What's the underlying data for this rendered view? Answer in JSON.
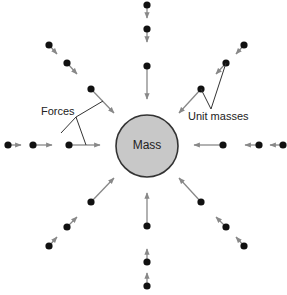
{
  "diagram": {
    "center_label": "Mass",
    "labels": {
      "forces": "Forces",
      "unit_masses": "Unit masses"
    },
    "colors": {
      "mass_fill": "#c8c8c8",
      "mass_stroke": "#333333",
      "dot": "#111111",
      "arrow": "#888888",
      "leader": "#333333"
    },
    "center": {
      "x": 147,
      "y": 146,
      "r": 31
    },
    "unit_masses": [
      {
        "x": 147,
        "y": 5,
        "tx": 147,
        "ty": 18
      },
      {
        "x": 147,
        "y": 29,
        "tx": 147,
        "ty": 42
      },
      {
        "x": 147,
        "y": 66,
        "tx": 147,
        "ty": 99
      },
      {
        "x": 147,
        "y": 286,
        "tx": 147,
        "ty": 273
      },
      {
        "x": 147,
        "y": 262,
        "tx": 147,
        "ty": 249
      },
      {
        "x": 147,
        "y": 226,
        "tx": 147,
        "ty": 193
      },
      {
        "x": 8,
        "y": 145,
        "tx": 21,
        "ty": 145
      },
      {
        "x": 33,
        "y": 145,
        "tx": 52,
        "ty": 145
      },
      {
        "x": 69,
        "y": 145,
        "tx": 100,
        "ty": 145
      },
      {
        "x": 283,
        "y": 145,
        "tx": 270,
        "ty": 145
      },
      {
        "x": 259,
        "y": 145,
        "tx": 245,
        "ty": 145
      },
      {
        "x": 223,
        "y": 145,
        "tx": 194,
        "ty": 145
      },
      {
        "x": 49,
        "y": 45,
        "tx": 57,
        "ty": 54
      },
      {
        "x": 67,
        "y": 63,
        "tx": 77,
        "ty": 74
      },
      {
        "x": 91,
        "y": 89,
        "tx": 114,
        "ty": 113
      },
      {
        "x": 244,
        "y": 45,
        "tx": 236,
        "ty": 54
      },
      {
        "x": 226,
        "y": 63,
        "tx": 216,
        "ty": 74
      },
      {
        "x": 201,
        "y": 89,
        "tx": 179,
        "ty": 113
      },
      {
        "x": 49,
        "y": 246,
        "tx": 57,
        "ty": 237
      },
      {
        "x": 67,
        "y": 227,
        "tx": 77,
        "ty": 217
      },
      {
        "x": 91,
        "y": 202,
        "tx": 114,
        "ty": 178
      },
      {
        "x": 244,
        "y": 246,
        "tx": 236,
        "ty": 237
      },
      {
        "x": 226,
        "y": 227,
        "tx": 216,
        "ty": 217
      },
      {
        "x": 201,
        "y": 202,
        "tx": 179,
        "ty": 178
      }
    ]
  }
}
